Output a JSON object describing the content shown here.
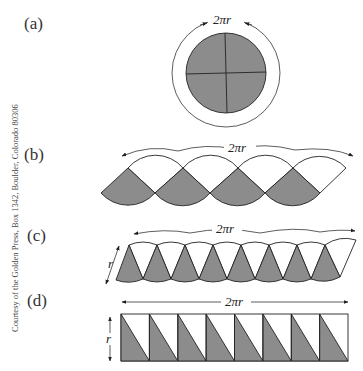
{
  "credit": "Courtesy of the Golden Press, Box 1342, Boulder, Colorado 80306",
  "panels": [
    {
      "label": "(a)",
      "dimension": "2πr",
      "description": "circle divided into 4 shaded quarter sectors; circumference 2πr"
    },
    {
      "label": "(b)",
      "dimension": "2πr",
      "description": "4 quarter sectors rearranged alternately up/down"
    },
    {
      "label": "(c)",
      "dimension": "2πr",
      "side": "r",
      "description": "8 sectors rearranged alternately up/down"
    },
    {
      "label": "(d)",
      "dimension": "2πr",
      "side": "r",
      "description": "infinitely many sectors approach rectangle r by πr"
    }
  ],
  "colors": {
    "shade": "#8c8c8c",
    "line": "#222222",
    "background": "#ffffff"
  }
}
